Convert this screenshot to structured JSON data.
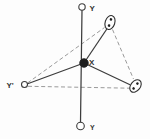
{
  "diagram": {
    "colors": {
      "background": "#fdfdfd",
      "solid_line": "#3c3c3c",
      "dashed_line": "#9a9a9a",
      "node_fill": "#ffffff",
      "center_dot": "#1e1e1e",
      "label_text": "#333333"
    },
    "labels": {
      "axis_top": "Y",
      "axis_bottom": "Y",
      "left_point": "Y'",
      "center_point": "X"
    },
    "nodes": {
      "axis_top_node": "open-circle",
      "axis_bottom_node": "open-circle",
      "left_node": "open-circle",
      "center_node": "filled-dot",
      "upper_right_node": "ellipse-with-two-dots",
      "right_node": "ellipse-with-two-dots"
    }
  }
}
